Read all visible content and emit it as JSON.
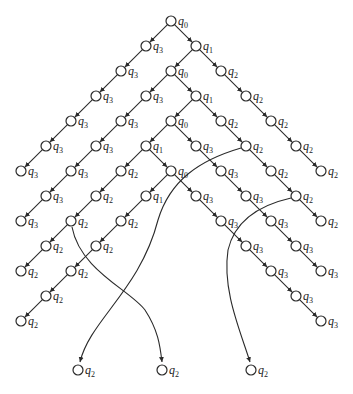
{
  "diagram": {
    "type": "computation-tree",
    "origin": {
      "x": 171,
      "y": 21
    },
    "step": {
      "dx": 25,
      "dy": 25
    },
    "node_radius": 5,
    "colors": {
      "stroke": "#2a2a2a",
      "fill": "#ffffff",
      "text": "#222222"
    },
    "nodes": [
      {
        "id": "n0",
        "state": "q0",
        "col": 0,
        "row": 0
      },
      {
        "id": "a1",
        "state": "q3",
        "col": -1,
        "row": 1
      },
      {
        "id": "a2",
        "state": "q3",
        "col": -2,
        "row": 2
      },
      {
        "id": "a3",
        "state": "q3",
        "col": -3,
        "row": 3
      },
      {
        "id": "a4",
        "state": "q3",
        "col": -4,
        "row": 4
      },
      {
        "id": "a5",
        "state": "q3",
        "col": -5,
        "row": 5
      },
      {
        "id": "a6",
        "state": "q3",
        "col": -6,
        "row": 6
      },
      {
        "id": "b1",
        "state": "q1",
        "col": 1,
        "row": 1
      },
      {
        "id": "b2",
        "state": "q0",
        "col": 0,
        "row": 2
      },
      {
        "id": "b3",
        "state": "q3",
        "col": -1,
        "row": 3
      },
      {
        "id": "b4",
        "state": "q3",
        "col": -2,
        "row": 4
      },
      {
        "id": "b5",
        "state": "q3",
        "col": -3,
        "row": 5
      },
      {
        "id": "b6",
        "state": "q3",
        "col": -4,
        "row": 6
      },
      {
        "id": "b7",
        "state": "q3",
        "col": -5,
        "row": 7
      },
      {
        "id": "b8",
        "state": "q3",
        "col": -6,
        "row": 8
      },
      {
        "id": "c2",
        "state": "q2",
        "col": 2,
        "row": 2
      },
      {
        "id": "c3",
        "state": "q2",
        "col": 3,
        "row": 3
      },
      {
        "id": "c4",
        "state": "q2",
        "col": 4,
        "row": 4
      },
      {
        "id": "c5",
        "state": "q2",
        "col": 5,
        "row": 5
      },
      {
        "id": "c6",
        "state": "q2",
        "col": 6,
        "row": 6
      },
      {
        "id": "d3",
        "state": "q1",
        "col": 1,
        "row": 3
      },
      {
        "id": "d4",
        "state": "q0",
        "col": 0,
        "row": 4
      },
      {
        "id": "d5",
        "state": "q1",
        "col": -1,
        "row": 5
      },
      {
        "id": "d6",
        "state": "q2",
        "col": -2,
        "row": 6
      },
      {
        "id": "d7",
        "state": "q2",
        "col": -3,
        "row": 7
      },
      {
        "id": "d8",
        "state": "q2",
        "col": -4,
        "row": 8
      },
      {
        "id": "d9",
        "state": "q2",
        "col": -5,
        "row": 9
      },
      {
        "id": "d10",
        "state": "q2",
        "col": -6,
        "row": 10
      },
      {
        "id": "e4",
        "state": "q2",
        "col": 2,
        "row": 4
      },
      {
        "id": "e5",
        "state": "q2",
        "col": 3,
        "row": 5
      },
      {
        "id": "e6",
        "state": "q2",
        "col": 4,
        "row": 6
      },
      {
        "id": "e7",
        "state": "q2",
        "col": 5,
        "row": 7
      },
      {
        "id": "e8",
        "state": "q2",
        "col": 6,
        "row": 8
      },
      {
        "id": "f5",
        "state": "q3",
        "col": 1,
        "row": 5
      },
      {
        "id": "f6",
        "state": "q3",
        "col": 2,
        "row": 6
      },
      {
        "id": "f7",
        "state": "q3",
        "col": 3,
        "row": 7
      },
      {
        "id": "f8",
        "state": "q3",
        "col": 4,
        "row": 8
      },
      {
        "id": "f9",
        "state": "q3",
        "col": 5,
        "row": 9
      },
      {
        "id": "f10",
        "state": "q3",
        "col": 6,
        "row": 10
      },
      {
        "id": "g6",
        "state": "q0",
        "col": 0,
        "row": 6
      },
      {
        "id": "g7",
        "state": "q1",
        "col": -1,
        "row": 7
      },
      {
        "id": "g8",
        "state": "q2",
        "col": -2,
        "row": 8
      },
      {
        "id": "g9",
        "state": "q2",
        "col": -3,
        "row": 9
      },
      {
        "id": "g10",
        "state": "q2",
        "col": -4,
        "row": 10
      },
      {
        "id": "g11",
        "state": "q2",
        "col": -5,
        "row": 11
      },
      {
        "id": "g12",
        "state": "q2",
        "col": -6,
        "row": 12
      },
      {
        "id": "h7",
        "state": "q3",
        "col": 1,
        "row": 7
      },
      {
        "id": "h8",
        "state": "q3",
        "col": 2,
        "row": 8
      },
      {
        "id": "h9",
        "state": "q3",
        "col": 3,
        "row": 9
      },
      {
        "id": "h10",
        "state": "q3",
        "col": 4,
        "row": 10
      },
      {
        "id": "h11",
        "state": "q3",
        "col": 5,
        "row": 11
      },
      {
        "id": "h12",
        "state": "q3",
        "col": 6,
        "row": 12
      },
      {
        "id": "z1",
        "state": "q2",
        "x": 78,
        "y": 370
      },
      {
        "id": "z2",
        "state": "q2",
        "x": 162,
        "y": 370
      },
      {
        "id": "z3",
        "state": "q2",
        "x": 251,
        "y": 370
      }
    ],
    "edges": [
      [
        "n0",
        "a1"
      ],
      [
        "a1",
        "a2"
      ],
      [
        "a2",
        "a3"
      ],
      [
        "a3",
        "a4"
      ],
      [
        "a4",
        "a5"
      ],
      [
        "a5",
        "a6"
      ],
      [
        "n0",
        "b1"
      ],
      [
        "b1",
        "b2"
      ],
      [
        "b2",
        "b3"
      ],
      [
        "b3",
        "b4"
      ],
      [
        "b4",
        "b5"
      ],
      [
        "b5",
        "b6"
      ],
      [
        "b6",
        "b7"
      ],
      [
        "b7",
        "b8"
      ],
      [
        "b1",
        "c2"
      ],
      [
        "c2",
        "c3"
      ],
      [
        "c3",
        "c4"
      ],
      [
        "c4",
        "c5"
      ],
      [
        "c5",
        "c6"
      ],
      [
        "b2",
        "d3"
      ],
      [
        "d3",
        "d4"
      ],
      [
        "d4",
        "d5"
      ],
      [
        "d5",
        "d6"
      ],
      [
        "d6",
        "d7"
      ],
      [
        "d7",
        "d8"
      ],
      [
        "d8",
        "d9"
      ],
      [
        "d9",
        "d10"
      ],
      [
        "d3",
        "e4"
      ],
      [
        "e4",
        "e5"
      ],
      [
        "e5",
        "e6"
      ],
      [
        "e6",
        "e7"
      ],
      [
        "e7",
        "e8"
      ],
      [
        "d4",
        "f5"
      ],
      [
        "f5",
        "f6"
      ],
      [
        "f6",
        "f7"
      ],
      [
        "f7",
        "f8"
      ],
      [
        "f8",
        "f9"
      ],
      [
        "f9",
        "f10"
      ],
      [
        "d5",
        "g6"
      ],
      [
        "g6",
        "g7"
      ],
      [
        "g7",
        "g8"
      ],
      [
        "g8",
        "g9"
      ],
      [
        "g9",
        "g10"
      ],
      [
        "g10",
        "g11"
      ],
      [
        "g11",
        "g12"
      ],
      [
        "g6",
        "h7"
      ],
      [
        "h7",
        "h8"
      ],
      [
        "h8",
        "h9"
      ],
      [
        "h9",
        "h10"
      ],
      [
        "h10",
        "h11"
      ],
      [
        "h11",
        "h12"
      ]
    ],
    "curves": [
      {
        "from": "e5",
        "to": "z1",
        "path": "M 241 148 C 200 160, 170 180, 158 220 C 140 290, 90 320, 80 362"
      },
      {
        "from": "d8",
        "to": "z2",
        "path": "M 72 227 C 80 270, 130 290, 145 310 C 158 330, 160 345, 162 362"
      },
      {
        "from": "e7",
        "to": "z3",
        "path": "M 291 198 C 260 205, 235 220, 228 250 C 222 290, 240 330, 250 362"
      }
    ]
  }
}
